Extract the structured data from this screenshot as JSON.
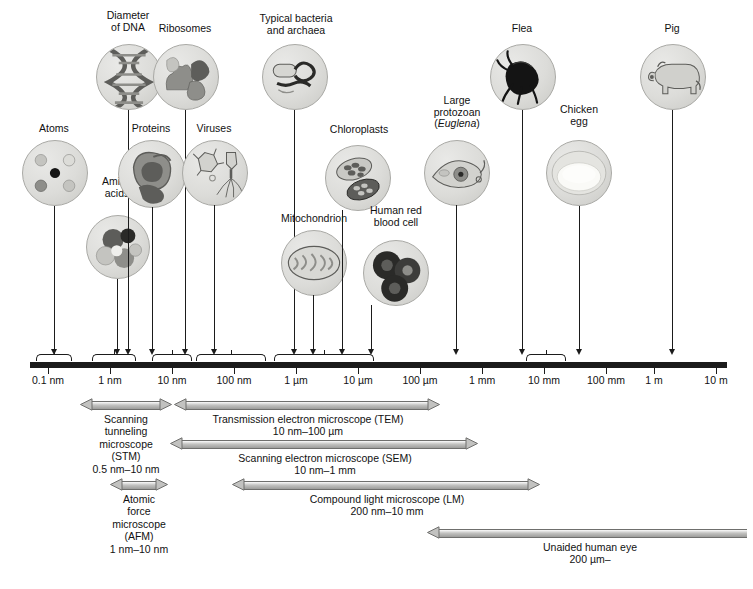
{
  "figure": {
    "caption": ""
  },
  "axis": {
    "label": "logarithmic size scale",
    "ticks": [
      {
        "label": "0.1 nm",
        "x": 48
      },
      {
        "label": "1 nm",
        "x": 110
      },
      {
        "label": "10 nm",
        "x": 172
      },
      {
        "label": "100 nm",
        "x": 234
      },
      {
        "label": "1 µm",
        "x": 296
      },
      {
        "label": "10 µm",
        "x": 358
      },
      {
        "label": "100 µm",
        "x": 420
      },
      {
        "label": "1 mm",
        "x": 482
      },
      {
        "label": "10 mm",
        "x": 544
      },
      {
        "label": "100 mm",
        "x": 606
      },
      {
        "label": "1 m",
        "x": 654
      },
      {
        "label": "10 m",
        "x": 716
      }
    ]
  },
  "specimens": [
    {
      "name": "atoms",
      "label": "Atoms",
      "bubble_x": 22,
      "bubble_y": 140,
      "bubble_d": 64,
      "label_x": 22,
      "label_y": 123,
      "label_w": 64,
      "drop_x": 54,
      "drop_top": 206,
      "drop_h": 143
    },
    {
      "name": "amino-acids",
      "label": "Amino\nacids",
      "bubble_x": 86,
      "bubble_y": 215,
      "bubble_d": 62,
      "label_x": 84,
      "label_y": 176,
      "label_w": 66,
      "drop_x": 117,
      "drop_top": 279,
      "drop_h": 70
    },
    {
      "name": "diameter-of-dna",
      "label": "Diameter\nof DNA",
      "bubble_x": 96,
      "bubble_y": 44,
      "bubble_d": 64,
      "label_x": 95,
      "label_y": 10,
      "label_w": 66,
      "drop_x": 128,
      "drop_top": 110,
      "drop_h": 239
    },
    {
      "name": "proteins",
      "label": "Proteins",
      "bubble_x": 118,
      "bubble_y": 140,
      "bubble_d": 66,
      "label_x": 118,
      "label_y": 123,
      "label_w": 66,
      "drop_x": 152,
      "drop_top": 207,
      "drop_h": 142
    },
    {
      "name": "ribosomes",
      "label": "Ribosomes",
      "bubble_x": 153,
      "bubble_y": 44,
      "bubble_d": 64,
      "label_x": 151,
      "label_y": 23,
      "label_w": 68,
      "drop_x": 185,
      "drop_top": 110,
      "drop_h": 239
    },
    {
      "name": "viruses",
      "label": "Viruses",
      "bubble_x": 182,
      "bubble_y": 140,
      "bubble_d": 64,
      "label_x": 182,
      "label_y": 123,
      "label_w": 64,
      "drop_x": 214,
      "drop_top": 205,
      "drop_h": 144
    },
    {
      "name": "typical-bacteria",
      "label": "Typical bacteria\nand archaea",
      "bubble_x": 262,
      "bubble_y": 44,
      "bubble_d": 64,
      "label_x": 249,
      "label_y": 13,
      "label_w": 94,
      "drop_x": 294,
      "drop_top": 110,
      "drop_h": 239
    },
    {
      "name": "mitochondrion",
      "label": "Mitochondrion",
      "bubble_x": 281,
      "bubble_y": 230,
      "bubble_d": 64,
      "label_x": 270,
      "label_y": 213,
      "label_w": 88,
      "drop_x": 313,
      "drop_top": 295,
      "drop_h": 54
    },
    {
      "name": "chloroplasts",
      "label": "Chloroplasts",
      "bubble_x": 325,
      "bubble_y": 145,
      "bubble_d": 64,
      "label_x": 320,
      "label_y": 124,
      "label_w": 78,
      "drop_x": 342,
      "drop_top": 210,
      "drop_h": 139
    },
    {
      "name": "human-red-blood-cell",
      "label": "Human red\nblood cell",
      "bubble_x": 363,
      "bubble_y": 240,
      "bubble_d": 64,
      "label_x": 356,
      "label_y": 205,
      "label_w": 80,
      "drop_x": 371,
      "drop_top": 305,
      "drop_h": 44
    },
    {
      "name": "large-protozoan",
      "label": "Large\nprotozoan\n(Euglena)",
      "bubble_x": 424,
      "bubble_y": 140,
      "bubble_d": 64,
      "label_x": 421,
      "label_y": 95,
      "label_w": 72,
      "drop_x": 456,
      "drop_top": 205,
      "drop_h": 144
    },
    {
      "name": "flea",
      "label": "Flea",
      "bubble_x": 490,
      "bubble_y": 44,
      "bubble_d": 64,
      "label_x": 488,
      "label_y": 23,
      "label_w": 68,
      "drop_x": 522,
      "drop_top": 110,
      "drop_h": 239
    },
    {
      "name": "chicken-egg",
      "label": "Chicken\negg",
      "bubble_x": 546,
      "bubble_y": 140,
      "bubble_d": 64,
      "label_x": 546,
      "label_y": 104,
      "label_w": 66,
      "drop_x": 579,
      "drop_top": 206,
      "drop_h": 143
    },
    {
      "name": "pig",
      "label": "Pig",
      "bubble_x": 640,
      "bubble_y": 44,
      "bubble_d": 64,
      "label_x": 638,
      "label_y": 23,
      "label_w": 68,
      "drop_x": 672,
      "drop_top": 110,
      "drop_h": 239
    }
  ],
  "braces": [
    {
      "name": "brace-0-1nm",
      "x": 36,
      "w": 36
    },
    {
      "name": "brace-1nm",
      "x": 92,
      "w": 44
    },
    {
      "name": "brace-10nm",
      "x": 152,
      "w": 40
    },
    {
      "name": "brace-100nm",
      "x": 196,
      "w": 70
    },
    {
      "name": "brace-um",
      "x": 274,
      "w": 100
    },
    {
      "name": "brace-10mm",
      "x": 526,
      "w": 40
    }
  ],
  "ranges": [
    {
      "name": "stm",
      "title": "Scanning\ntunneling\nmicroscope\n(STM)",
      "value": "0.5 nm–10 nm",
      "x": 80,
      "w": 92,
      "y": 398,
      "left_head": true,
      "right_head": true,
      "cap_x": 86,
      "cap_y": 413,
      "cap_w": 80
    },
    {
      "name": "tem",
      "title": "Transmission electron microscope (TEM)",
      "value": "10 nm–100 µm",
      "x": 174,
      "w": 266,
      "y": 398,
      "left_head": true,
      "right_head": true,
      "cap_x": 180,
      "cap_y": 413,
      "cap_w": 256
    },
    {
      "name": "sem",
      "title": "Scanning electron microscope (SEM)",
      "value": "10 nm–1 mm",
      "x": 170,
      "w": 308,
      "y": 437,
      "left_head": true,
      "right_head": true,
      "cap_x": 176,
      "cap_y": 452,
      "cap_w": 298
    },
    {
      "name": "afm",
      "title": "Atomic\nforce\nmicroscope\n(AFM)",
      "value": "1 nm–10 nm",
      "x": 110,
      "w": 58,
      "y": 478,
      "left_head": true,
      "right_head": true,
      "cap_x": 98,
      "cap_y": 493,
      "cap_w": 82
    },
    {
      "name": "lm",
      "title": "Compound light microscope (LM)",
      "value": "200 nm–10 mm",
      "x": 232,
      "w": 308,
      "y": 478,
      "left_head": true,
      "right_head": true,
      "cap_x": 238,
      "cap_y": 493,
      "cap_w": 298
    },
    {
      "name": "unaided-eye",
      "title": "Unaided human eye",
      "value": "200 µm–",
      "x": 427,
      "w": 320,
      "y": 526,
      "left_head": true,
      "right_head": false,
      "cap_x": 440,
      "cap_y": 541,
      "cap_w": 300
    }
  ]
}
